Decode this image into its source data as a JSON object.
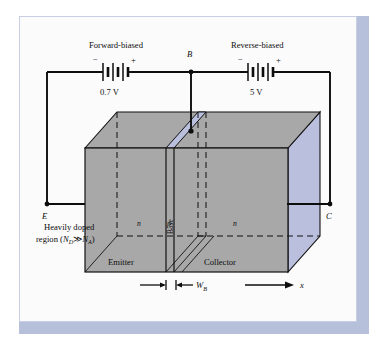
{
  "figure": {
    "frame_color": "#b7c0da",
    "page_color": "#fbfbfc",
    "block_face_color": "#a8a8a8",
    "block_top_color": "#a8a8a8",
    "base_highlight_color": "#b9bfdc",
    "right_face_color": "#b9bfdc",
    "wire_color": "#0d0d0d"
  },
  "sources": {
    "left": {
      "caption": "Forward-biased",
      "minus": "−",
      "plus": "+",
      "value": "0.7 V"
    },
    "right": {
      "caption": "Reverse-biased",
      "minus": "−",
      "plus": "+",
      "value": "5 V"
    }
  },
  "terminals": {
    "emitter": "E",
    "base": "B",
    "collector": "C"
  },
  "annotations": {
    "heavily_doped_line1": "Heavily doped",
    "heavily_doped_line2_pre": "region (",
    "heavily_doped_nd": "N",
    "heavily_doped_nd_sub": "D",
    "heavily_doped_gg": "≫",
    "heavily_doped_na": "N",
    "heavily_doped_na_sub": "A",
    "heavily_doped_line2_post": ")",
    "region_n_left": "n",
    "region_p": "p",
    "region_n_right": "n",
    "base_vertical": "Base",
    "emitter_label": "Emitter",
    "collector_label": "Collector",
    "width_symbol": "W",
    "width_subscript": "B",
    "axis_symbol": "x"
  }
}
